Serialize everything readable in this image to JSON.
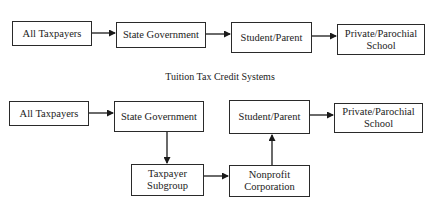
{
  "diagrams": [
    {
      "title": "",
      "nodes": [
        {
          "id": "taxpayers",
          "label": "All Taxpayers"
        },
        {
          "id": "state",
          "label": "State Government"
        },
        {
          "id": "student",
          "label": "Student/Parent"
        },
        {
          "id": "school",
          "label": "Private/Parochial School"
        }
      ],
      "edges": [
        [
          "taxpayers",
          "state"
        ],
        [
          "state",
          "student"
        ],
        [
          "student",
          "school"
        ]
      ]
    },
    {
      "title": "Tuition Tax Credit Systems",
      "nodes": [
        {
          "id": "taxpayers",
          "label": "All Taxpayers"
        },
        {
          "id": "state",
          "label": "State Government"
        },
        {
          "id": "student",
          "label": "Student/Parent"
        },
        {
          "id": "school",
          "label": "Private/Parochial School"
        },
        {
          "id": "subgroup",
          "label": "Taxpayer Subgroup"
        },
        {
          "id": "nonprofit",
          "label": "Nonprofit Corporation"
        }
      ],
      "edges": [
        [
          "taxpayers",
          "state"
        ],
        [
          "state",
          "subgroup"
        ],
        [
          "subgroup",
          "nonprofit"
        ],
        [
          "nonprofit",
          "student"
        ],
        [
          "student",
          "school"
        ]
      ]
    }
  ]
}
